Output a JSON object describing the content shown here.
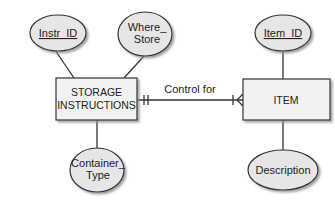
{
  "diagram": {
    "type": "entity-relationship",
    "colors": {
      "entity_fill": "#f2f2f2",
      "attribute_fill": "#e6e6e6",
      "stroke": "#333333",
      "shadow": "#9a9a9a"
    },
    "entities": [
      {
        "id": "storage_instructions",
        "label_line1": "STORAGE",
        "label_line2": "INSTRUCTIONS",
        "attributes": [
          {
            "id": "instr_id",
            "label": "Instr_ID",
            "key": true
          },
          {
            "id": "where_store",
            "label_line1": "Where_",
            "label_line2": "Store",
            "key": false
          },
          {
            "id": "container_type",
            "label_line1": "Container_",
            "label_line2": "Type",
            "key": false
          }
        ]
      },
      {
        "id": "item",
        "label": "ITEM",
        "attributes": [
          {
            "id": "item_id",
            "label": "Item_ID",
            "key": true
          },
          {
            "id": "description",
            "label": "Description",
            "key": false
          }
        ]
      }
    ],
    "relationships": [
      {
        "label": "Control for",
        "from": "storage_instructions",
        "to": "item",
        "from_cardinality": "one-and-only-one",
        "to_cardinality": "one-or-many"
      }
    ]
  }
}
